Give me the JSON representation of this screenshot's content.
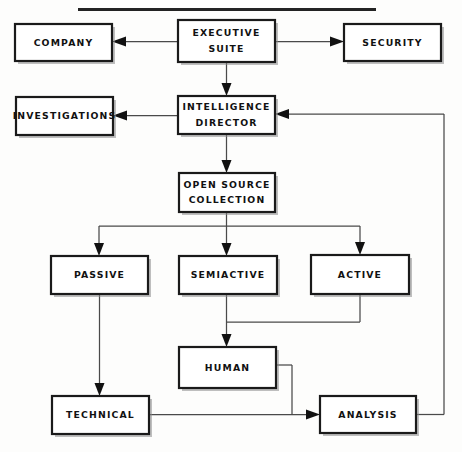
{
  "diagram": {
    "title_rule": "top-horizontal-rule",
    "background_color": "#fdfdfc",
    "line_color": "#4a4a4a",
    "box_border_color": "#1a1a1a",
    "text_color": "#111111",
    "nodes": [
      {
        "id": "company",
        "label": "COMPANY",
        "x": 15,
        "y": 24,
        "w": 97,
        "h": 37,
        "lines": [
          "COMPANY"
        ]
      },
      {
        "id": "executive",
        "label": "EXECUTIVE SUITE",
        "x": 178,
        "y": 20,
        "w": 97,
        "h": 42,
        "lines": [
          "EXECUTIVE",
          "SUITE"
        ]
      },
      {
        "id": "security",
        "label": "SECURITY",
        "x": 344,
        "y": 24,
        "w": 97,
        "h": 37,
        "lines": [
          "SECURITY"
        ]
      },
      {
        "id": "investigations",
        "label": "INVESTIGATIONS",
        "x": 16,
        "y": 97,
        "w": 97,
        "h": 38,
        "lines": [
          "INVESTIGATIONS"
        ]
      },
      {
        "id": "intel",
        "label": "INTELLIGENCE DIRECTOR",
        "x": 178,
        "y": 96,
        "w": 97,
        "h": 38,
        "lines": [
          "INTELLIGENCE",
          "DIRECTOR"
        ]
      },
      {
        "id": "opensource",
        "label": "OPEN SOURCE COLLECTION",
        "x": 179,
        "y": 173,
        "w": 96,
        "h": 39,
        "lines": [
          "OPEN SOURCE",
          "COLLECTION"
        ]
      },
      {
        "id": "passive",
        "label": "PASSIVE",
        "x": 51,
        "y": 256,
        "w": 97,
        "h": 38,
        "lines": [
          "PASSIVE"
        ]
      },
      {
        "id": "semiactive",
        "label": "SEMIACTIVE",
        "x": 179,
        "y": 256,
        "w": 98,
        "h": 38,
        "lines": [
          "SEMIACTIVE"
        ]
      },
      {
        "id": "active",
        "label": "ACTIVE",
        "x": 311,
        "y": 255,
        "w": 98,
        "h": 39,
        "lines": [
          "ACTIVE"
        ]
      },
      {
        "id": "human",
        "label": "HUMAN",
        "x": 179,
        "y": 347,
        "w": 97,
        "h": 41,
        "lines": [
          "HUMAN"
        ]
      },
      {
        "id": "technical",
        "label": "TECHNICAL",
        "x": 52,
        "y": 396,
        "w": 97,
        "h": 38,
        "lines": [
          "TECHNICAL"
        ]
      },
      {
        "id": "analysis",
        "label": "ANALYSIS",
        "x": 320,
        "y": 396,
        "w": 96,
        "h": 37,
        "lines": [
          "ANALYSIS"
        ]
      }
    ],
    "connections": [
      {
        "id": "exec-to-company",
        "from": "executive",
        "to": "company",
        "kind": "horizontal-arrow-left"
      },
      {
        "id": "exec-to-security",
        "from": "executive",
        "to": "security",
        "kind": "horizontal-arrow-right"
      },
      {
        "id": "exec-to-intel",
        "from": "executive",
        "to": "intel",
        "kind": "vertical-arrow-down"
      },
      {
        "id": "intel-to-investigations",
        "from": "intel",
        "to": "investigations",
        "kind": "horizontal-arrow-left"
      },
      {
        "id": "intel-to-opensource",
        "from": "intel",
        "to": "opensource",
        "kind": "vertical-arrow-down"
      },
      {
        "id": "opensource-to-passive",
        "from": "opensource",
        "to": "passive",
        "kind": "bus-branch-down"
      },
      {
        "id": "opensource-to-semiactive",
        "from": "opensource",
        "to": "semiactive",
        "kind": "vertical-arrow-down"
      },
      {
        "id": "opensource-to-active",
        "from": "opensource",
        "to": "active",
        "kind": "bus-branch-down"
      },
      {
        "id": "semiactive-active-to-human",
        "from": "semiactive",
        "to": "human",
        "kind": "merge-arrow-down"
      },
      {
        "id": "passive-to-technical",
        "from": "passive",
        "to": "technical",
        "kind": "vertical-arrow-down"
      },
      {
        "id": "technical-to-analysis",
        "from": "technical",
        "to": "analysis",
        "kind": "horizontal-arrow-right"
      },
      {
        "id": "human-to-analysis",
        "from": "human",
        "to": "analysis",
        "kind": "elbow-arrow-right"
      },
      {
        "id": "analysis-to-intel",
        "from": "analysis",
        "to": "intel",
        "kind": "feedback-loop-left"
      }
    ]
  }
}
